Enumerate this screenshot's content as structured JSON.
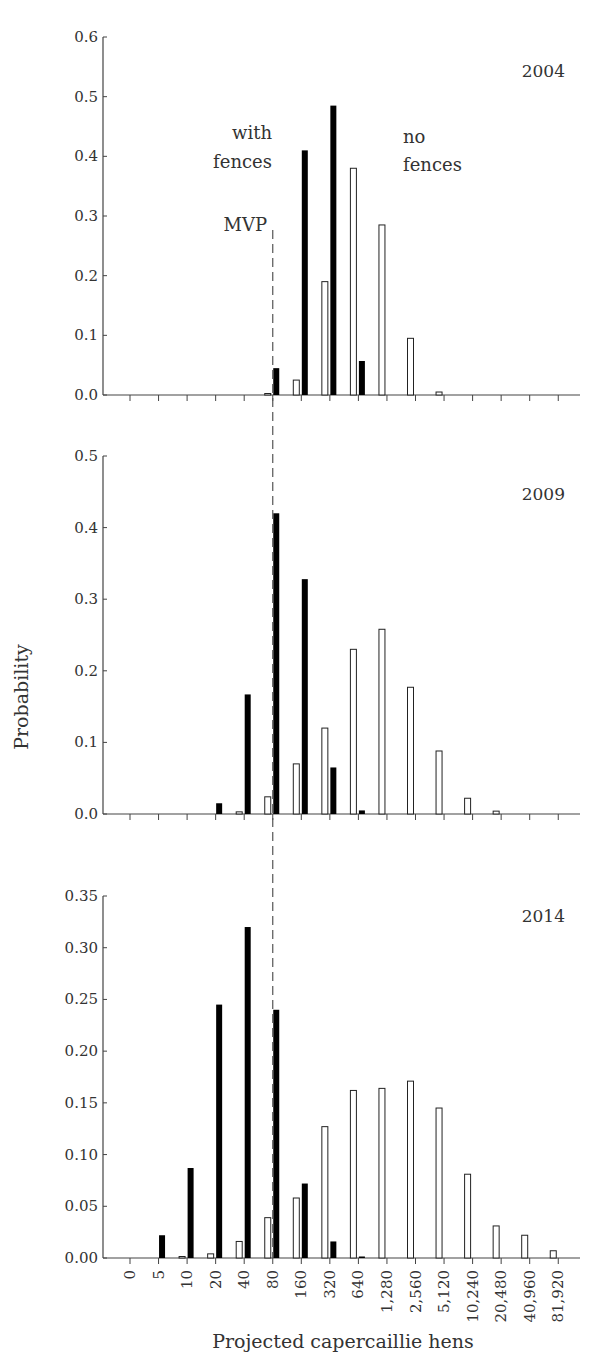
{
  "chart_data": {
    "type": "bar",
    "layout": "three vertically stacked panels sharing x-axis",
    "xlabel": "Projected capercaillie hens",
    "ylabel": "Probability",
    "categories": [
      "0",
      "5",
      "10",
      "20",
      "40",
      "80",
      "160",
      "320",
      "640",
      "1,280",
      "2,560",
      "5,120",
      "10,240",
      "20,480",
      "40,960",
      "81,920"
    ],
    "legend_annotations": {
      "with_fences": [
        "with",
        "fences"
      ],
      "no_fences": [
        "no",
        "fences"
      ],
      "mvp": "MVP"
    },
    "mvp_category": "80",
    "series_styles": {
      "no_fences": {
        "fill": "#ffffff",
        "stroke": "#222222"
      },
      "with_fences": {
        "fill": "#000000"
      }
    },
    "panels": [
      {
        "title": "2004",
        "ylim": [
          0,
          0.6
        ],
        "yticks": [
          "0.0",
          "0.1",
          "0.2",
          "0.3",
          "0.4",
          "0.5",
          "0.6"
        ],
        "ytick_values": [
          0,
          0.1,
          0.2,
          0.3,
          0.4,
          0.5,
          0.6
        ],
        "show_annotations": true,
        "series": [
          {
            "name": "no fences",
            "values": [
              0,
              0,
              0,
              0,
              0,
              0.002,
              0.025,
              0.19,
              0.38,
              0.285,
              0.095,
              0.005,
              0,
              0,
              0,
              0
            ]
          },
          {
            "name": "with fences",
            "values": [
              0,
              0,
              0,
              0,
              0,
              0.045,
              0.41,
              0.485,
              0.057,
              0,
              0,
              0,
              0,
              0,
              0,
              0
            ]
          }
        ]
      },
      {
        "title": "2009",
        "ylim": [
          0,
          0.5
        ],
        "yticks": [
          "0.0",
          "0.1",
          "0.2",
          "0.3",
          "0.4",
          "0.5"
        ],
        "ytick_values": [
          0,
          0.1,
          0.2,
          0.3,
          0.4,
          0.5
        ],
        "show_annotations": false,
        "series": [
          {
            "name": "no fences",
            "values": [
              0,
              0,
              0,
              0,
              0.003,
              0.024,
              0.07,
              0.12,
              0.23,
              0.258,
              0.177,
              0.088,
              0.022,
              0.004,
              0,
              0
            ]
          },
          {
            "name": "with fences",
            "values": [
              0,
              0,
              0,
              0.015,
              0.167,
              0.42,
              0.328,
              0.065,
              0.005,
              0,
              0,
              0,
              0,
              0,
              0,
              0
            ]
          }
        ]
      },
      {
        "title": "2014",
        "ylim": [
          0,
          0.35
        ],
        "yticks": [
          "0.00",
          "0.05",
          "0.10",
          "0.15",
          "0.20",
          "0.25",
          "0.30",
          "0.35"
        ],
        "ytick_values": [
          0,
          0.05,
          0.1,
          0.15,
          0.2,
          0.25,
          0.3,
          0.35
        ],
        "show_annotations": false,
        "series": [
          {
            "name": "no fences",
            "values": [
              0,
              0,
              0.001,
              0.004,
              0.016,
              0.039,
              0.058,
              0.127,
              0.162,
              0.164,
              0.171,
              0.145,
              0.081,
              0.031,
              0.022,
              0.007
            ]
          },
          {
            "name": "with fences",
            "values": [
              0,
              0.022,
              0.087,
              0.245,
              0.32,
              0.24,
              0.072,
              0.016,
              0.001,
              0,
              0,
              0,
              0,
              0,
              0,
              0
            ]
          }
        ]
      }
    ]
  }
}
